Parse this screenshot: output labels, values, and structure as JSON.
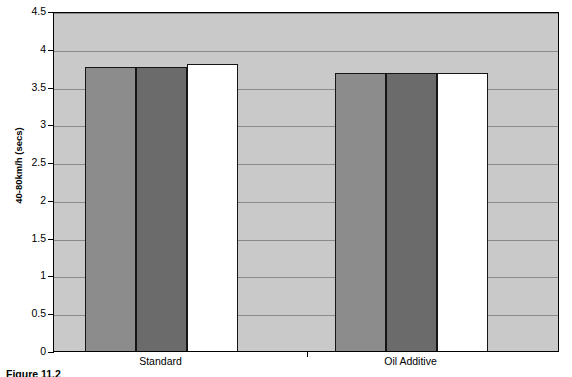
{
  "chart_data": {
    "type": "bar",
    "title": "",
    "xlabel": "",
    "ylabel": "40-80km/h (secs)",
    "ylim": [
      0,
      4.5
    ],
    "yticks": [
      "0",
      "0.5",
      "1",
      "1.5",
      "2",
      "2.5",
      "3",
      "3.5",
      "4",
      "4.5"
    ],
    "ytick_values": [
      0,
      0.5,
      1,
      1.5,
      2,
      2.5,
      3,
      3.5,
      4,
      4.5
    ],
    "grid": "horizontal",
    "legend": "none",
    "categories": [
      "Standard",
      "Oil Additive"
    ],
    "series": [
      {
        "name": "series-1",
        "color": "#8c8c8c",
        "values": [
          3.78,
          3.7
        ]
      },
      {
        "name": "series-2",
        "color": "#6b6b6b",
        "values": [
          3.79,
          3.7
        ]
      },
      {
        "name": "series-3",
        "color": "#ffffff",
        "values": [
          3.82,
          3.71
        ]
      }
    ],
    "plot_background": "#c9c9c9",
    "gridline_color": "#8a8a8a",
    "axis_color": "#000000"
  },
  "axis": {
    "y_title": "40-80km/h (secs)"
  },
  "groups": [
    {
      "label": "Standard"
    },
    {
      "label": "Oil Additive"
    }
  ],
  "caption": {
    "text": "Figure 11.2"
  }
}
